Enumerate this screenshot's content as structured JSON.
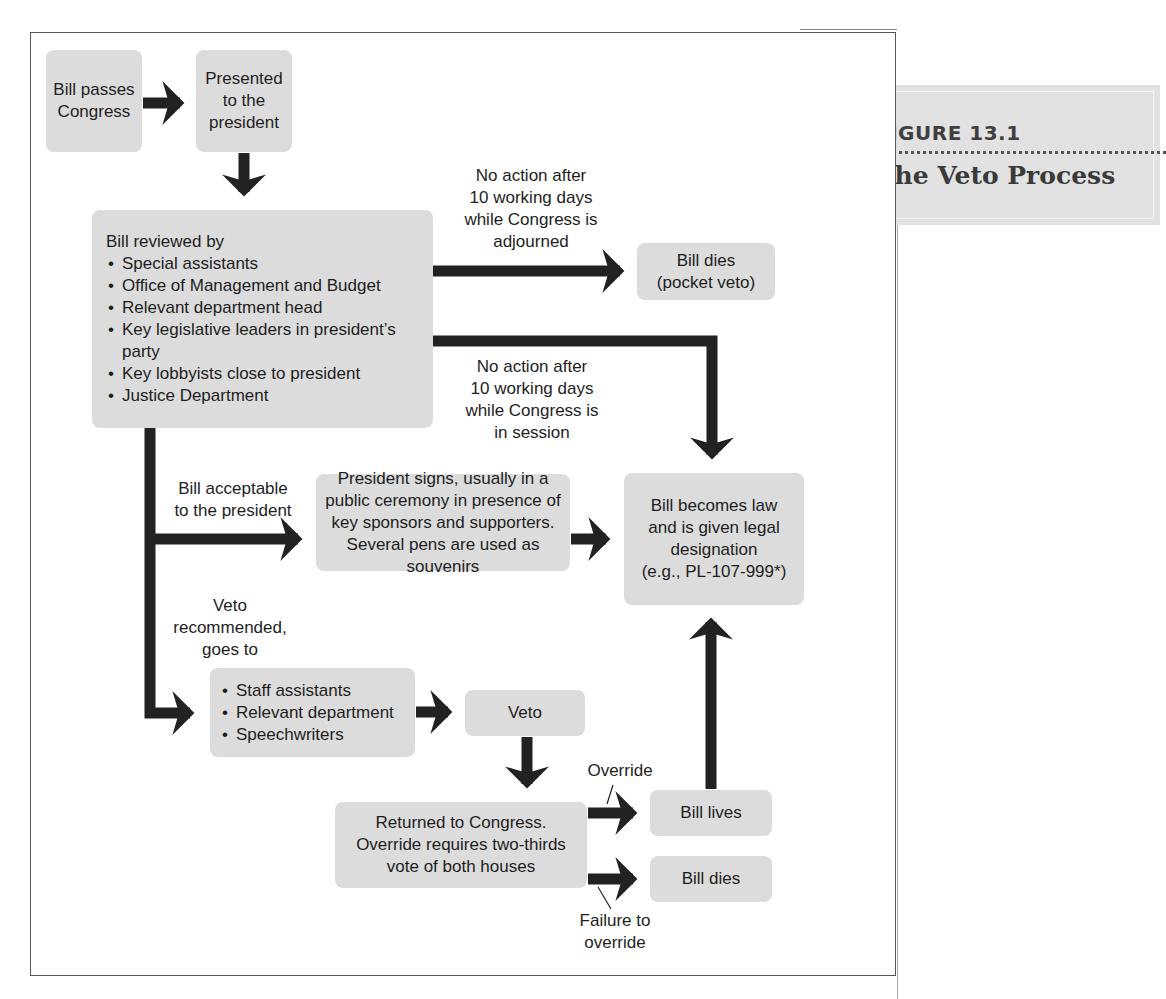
{
  "figure": {
    "number": "FIGURE 13.1",
    "title": "The Veto Process"
  },
  "nodes": {
    "bill_passes": "Bill passes Congress",
    "presented": "Presented to the president",
    "reviewed": {
      "heading": "Bill reviewed by",
      "items": [
        "Special assistants",
        "Office of Management and Budget",
        "Relevant department head",
        "Key legislative leaders in president’s party",
        "Key lobbyists close to president",
        "Justice Department"
      ]
    },
    "pocket_veto": {
      "line1": "Bill dies",
      "line2": "(pocket veto)"
    },
    "president_signs": "President signs, usually in a public ceremony in presence of key sponsors and supporters. Several pens are used as souvenirs",
    "becomes_law": {
      "line1": "Bill becomes law",
      "line2": "and is given legal",
      "line3": "designation",
      "line4": "(e.g., PL-107-999*)"
    },
    "staff": {
      "items": [
        "Staff assistants",
        "Relevant department",
        "Speechwriters"
      ]
    },
    "veto": "Veto",
    "returned": {
      "line1": "Returned to Congress.",
      "line2": "Override requires two-thirds",
      "line3": "vote of both houses"
    },
    "bill_lives": "Bill lives",
    "bill_dies": "Bill dies"
  },
  "edge_labels": {
    "adjourned": {
      "line1": "No action after",
      "line2": "10 working days",
      "line3": "while Congress is",
      "line4": "adjourned"
    },
    "in_session": {
      "line1": "No action after",
      "line2": "10 working days",
      "line3": "while Congress is",
      "line4": "in session"
    },
    "acceptable": {
      "line1": "Bill acceptable",
      "line2": "to the president"
    },
    "veto_recommended": {
      "line1": "Veto",
      "line2": "recommended,",
      "line3": "goes to"
    },
    "override": "Override",
    "failure": {
      "line1": "Failure to",
      "line2": "override"
    }
  },
  "colors": {
    "box_fill": "#dcdcdc",
    "arrow": "#222222",
    "figure_box": "#e2e2e2"
  }
}
